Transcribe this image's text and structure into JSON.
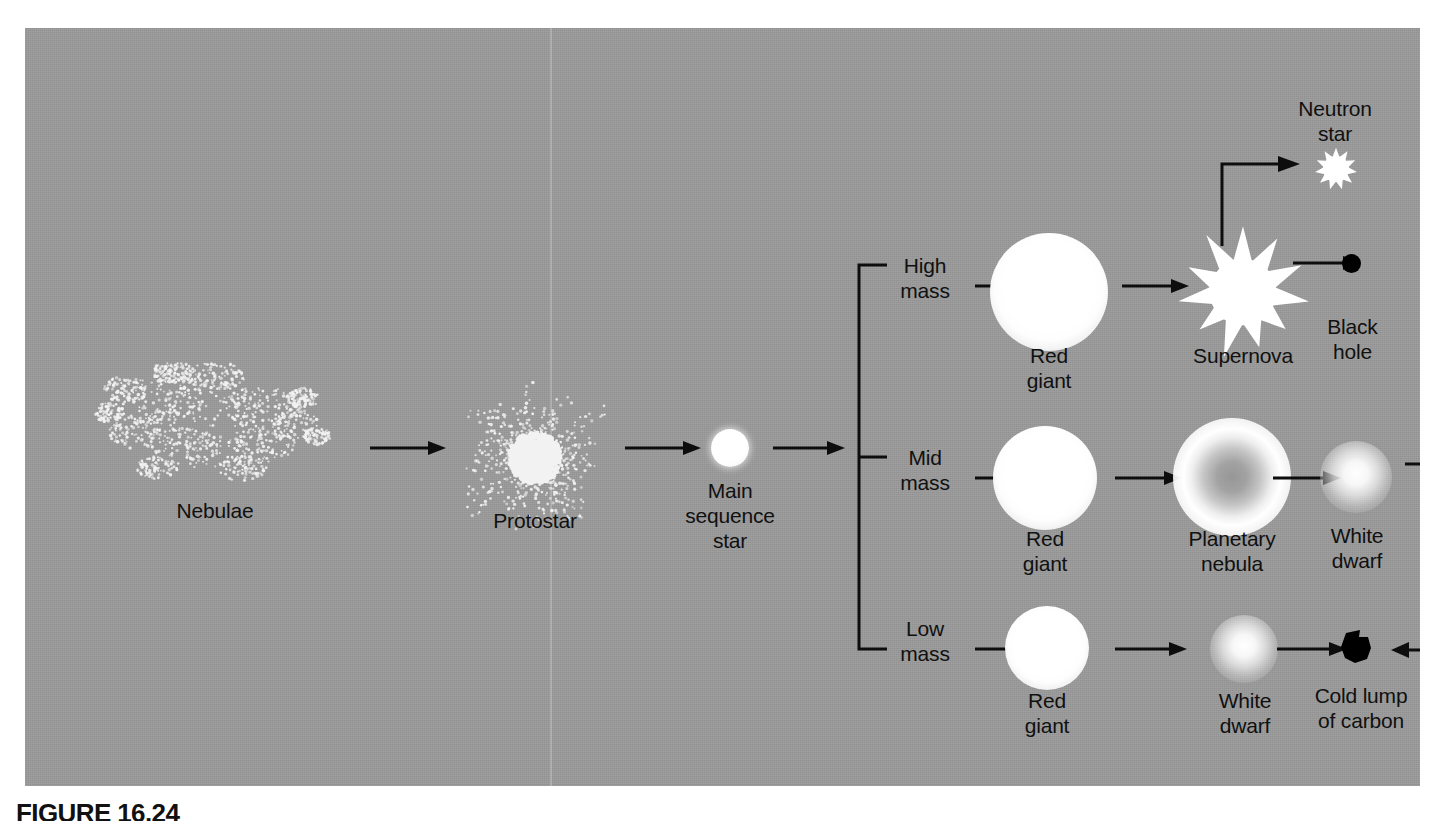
{
  "figure": {
    "caption": "FIGURE 16.24",
    "background_color": "#9a9a9a",
    "ink_color": "#0d0d0d",
    "star_color": "#ffffff"
  },
  "stages": {
    "nebulae": {
      "label": "Nebulae",
      "icon": "nebula-dot-cloud-icon"
    },
    "protostar": {
      "label": "Protostar",
      "icon": "protostar-burst-icon"
    },
    "main_sequence_star": {
      "label": "Main\nsequence\nstar",
      "icon": "main-sequence-star-icon"
    }
  },
  "branches": [
    {
      "id": "high-mass",
      "label": "High\nmass",
      "stages": [
        {
          "id": "red-giant-high",
          "label": "Red\ngiant",
          "icon": "red-giant-icon"
        },
        {
          "id": "supernova",
          "label": "Supernova",
          "icon": "supernova-burst-icon"
        },
        {
          "id": "black-hole",
          "label": "Black\nhole",
          "icon": "black-hole-icon"
        }
      ],
      "offshoot": {
        "id": "neutron-star",
        "label": "Neutron\nstar",
        "icon": "neutron-star-icon"
      }
    },
    {
      "id": "mid-mass",
      "label": "Mid\nmass",
      "stages": [
        {
          "id": "red-giant-mid",
          "label": "Red\ngiant",
          "icon": "red-giant-icon"
        },
        {
          "id": "planetary-nebula",
          "label": "Planetary\nnebula",
          "icon": "planetary-nebula-icon"
        },
        {
          "id": "white-dwarf-mid",
          "label": "White\ndwarf",
          "icon": "white-dwarf-icon"
        }
      ]
    },
    {
      "id": "low-mass",
      "label": "Low\nmass",
      "stages": [
        {
          "id": "red-giant-low",
          "label": "Red\ngiant",
          "icon": "red-giant-icon"
        },
        {
          "id": "white-dwarf-low",
          "label": "White\ndwarf",
          "icon": "white-dwarf-icon"
        },
        {
          "id": "cold-lump-of-carbon",
          "label": "Cold lump\nof carbon",
          "icon": "carbon-lump-icon"
        }
      ]
    }
  ],
  "chart_data": {
    "type": "diagram",
    "title": "FIGURE 16.24",
    "nodes": [
      "Nebulae",
      "Protostar",
      "Main sequence star",
      "High mass",
      "Red giant",
      "Supernova",
      "Neutron star",
      "Black hole",
      "Mid mass",
      "Red giant",
      "Planetary nebula",
      "White dwarf",
      "Low mass",
      "Red giant",
      "White dwarf",
      "Cold lump of carbon"
    ],
    "edges": [
      [
        "Nebulae",
        "Protostar"
      ],
      [
        "Protostar",
        "Main sequence star"
      ],
      [
        "Main sequence star",
        "High mass"
      ],
      [
        "Main sequence star",
        "Mid mass"
      ],
      [
        "Main sequence star",
        "Low mass"
      ],
      [
        "High mass",
        "Red giant (high mass)"
      ],
      [
        "Red giant (high mass)",
        "Supernova"
      ],
      [
        "Supernova",
        "Neutron star"
      ],
      [
        "Supernova",
        "Black hole"
      ],
      [
        "Mid mass",
        "Red giant (mid mass)"
      ],
      [
        "Red giant (mid mass)",
        "Planetary nebula"
      ],
      [
        "Planetary nebula",
        "White dwarf (mid mass)"
      ],
      [
        "White dwarf (mid mass)",
        "Cold lump of carbon"
      ],
      [
        "Low mass",
        "Red giant (low mass)"
      ],
      [
        "Red giant (low mass)",
        "White dwarf (low mass)"
      ],
      [
        "White dwarf (low mass)",
        "Cold lump of carbon"
      ]
    ]
  }
}
